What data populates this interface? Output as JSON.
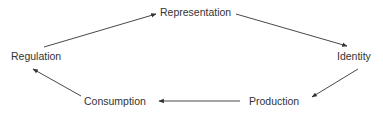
{
  "diagram": {
    "type": "cycle",
    "nodes": [
      {
        "id": "representation",
        "label": "Representation"
      },
      {
        "id": "identity",
        "label": "Identity"
      },
      {
        "id": "production",
        "label": "Production"
      },
      {
        "id": "consumption",
        "label": "Consumption"
      },
      {
        "id": "regulation",
        "label": "Regulation"
      }
    ],
    "edges": [
      {
        "from": "representation",
        "to": "identity"
      },
      {
        "from": "identity",
        "to": "production"
      },
      {
        "from": "production",
        "to": "consumption"
      },
      {
        "from": "consumption",
        "to": "regulation"
      },
      {
        "from": "regulation",
        "to": "representation"
      }
    ],
    "colors": {
      "text": "#333333",
      "arrow": "#333333",
      "background": "#ffffff"
    }
  }
}
